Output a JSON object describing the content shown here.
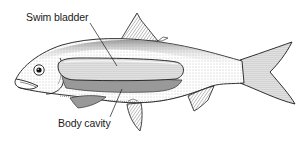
{
  "figure": {
    "labels": [
      {
        "id": "swim-bladder",
        "text": "Swim bladder"
      },
      {
        "id": "body-cavity",
        "text": "Body cavity"
      }
    ]
  },
  "colors": {
    "background": "#ffffff",
    "ink": "#1a1a1a",
    "stipple_light": "#d9d9d9",
    "stipple_mid": "#9a9a9a",
    "stipple_dark": "#555555"
  }
}
